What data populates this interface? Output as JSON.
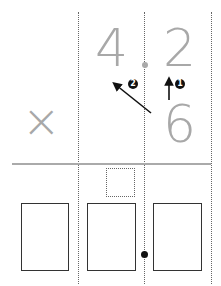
{
  "problem": {
    "multiplicand": {
      "tens": "4",
      "ones": "2"
    },
    "multiplier": "6",
    "operator": "×",
    "steps": [
      {
        "label": "❶",
        "number": "1"
      },
      {
        "label": "❷",
        "number": "2"
      }
    ]
  },
  "answer": {
    "carry_box": "",
    "boxes": [
      "",
      "",
      ""
    ]
  },
  "colors": {
    "digit": "#a8a8a8",
    "arrow": "#111111",
    "box_border": "#333333"
  }
}
